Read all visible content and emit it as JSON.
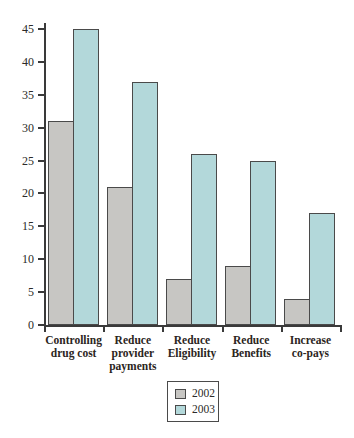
{
  "chart_data": {
    "type": "bar",
    "title": "",
    "xlabel": "",
    "ylabel": "",
    "categories": [
      "Controlling drug cost",
      "Reduce provider payments",
      "Reduce Eligibility",
      "Reduce Benefits",
      "Increase co-pays"
    ],
    "category_label_lines": [
      "Controlling\ndrug cost",
      "Reduce\nprovider\npayments",
      "Reduce\nEligibility",
      "Reduce\nBenefits",
      "Increase\nco-pays"
    ],
    "series": [
      {
        "name": "2002",
        "color": "#c7c6c3",
        "values": [
          31,
          21,
          7,
          9,
          4
        ]
      },
      {
        "name": "2003",
        "color": "#b3d8da",
        "values": [
          45,
          37,
          26,
          25,
          17
        ]
      }
    ],
    "ylim": [
      0,
      45
    ],
    "yticks": [
      0,
      5,
      10,
      15,
      20,
      25,
      30,
      35,
      40,
      45
    ],
    "grid": false,
    "legend_position": "bottom-center",
    "bar_border_color": "#4a4a4a",
    "axis_color": "#3a3a3a"
  },
  "legend": {
    "entries": [
      {
        "label": "2002",
        "color": "#c7c6c3"
      },
      {
        "label": "2003",
        "color": "#b3d8da"
      }
    ]
  }
}
